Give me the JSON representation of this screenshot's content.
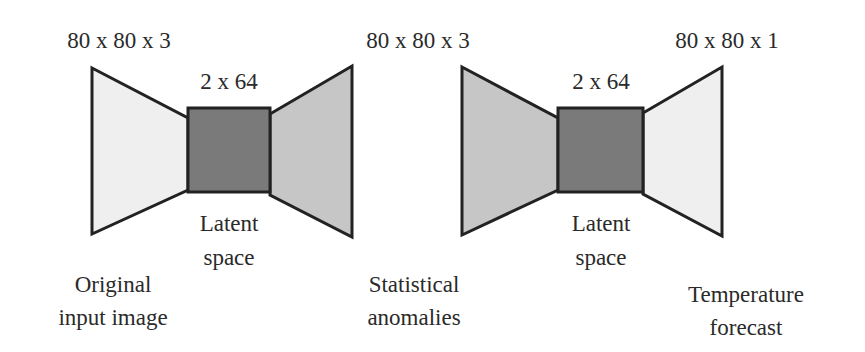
{
  "colors": {
    "light_fill": "#efefef",
    "medium_fill": "#c6c6c6",
    "dark_fill": "#7a7a7a",
    "stroke": "#222222",
    "text": "#2a2a2a"
  },
  "autoencoders": [
    {
      "input_dim": "80 x 80 x 3",
      "latent_dim": "2 x 64",
      "latent_label_1": "Latent",
      "latent_label_2": "space",
      "output_dim": "80 x 80 x 3",
      "input_label_1": "Original",
      "input_label_2": "input image",
      "encoder_fill": "light",
      "decoder_fill": "medium"
    },
    {
      "latent_dim": "2 x 64",
      "latent_label_1": "Latent",
      "latent_label_2": "space",
      "output_dim": "80 x 80 x 1",
      "input_label_1": "Statistical",
      "input_label_2": "anomalies",
      "output_label_1": "Temperature",
      "output_label_2": "forecast",
      "encoder_fill": "medium",
      "decoder_fill": "light"
    }
  ]
}
